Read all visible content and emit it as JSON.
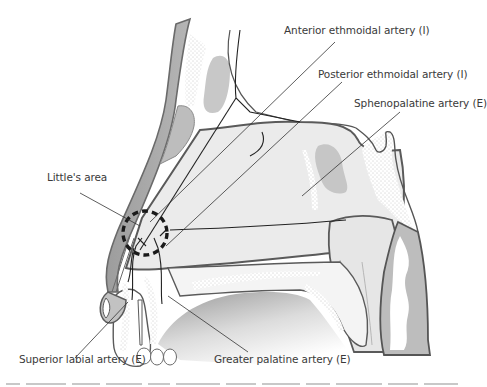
{
  "figure": {
    "labels": {
      "anterior_ethmoidal": "Anterior ethmoidal artery (I)",
      "posterior_ethmoidal": "Posterior ethmoidal artery (I)",
      "sphenopalatine": "Sphenopalatine artery (E)",
      "littles_area": "Little's area",
      "superior_labial": "Superior labial artery (E)",
      "greater_palatine": "Greater palatine artery (E)"
    },
    "legend_note": {
      "I": "Internal carotid branch",
      "E": "External carotid branch"
    },
    "colors": {
      "outline": "#5a5a5a",
      "cartilage": "#a9a9a9",
      "mucosa": "#e9e9e9",
      "sinus": "#c9c9c9",
      "artery": "#222222",
      "leader": "#333333"
    }
  }
}
